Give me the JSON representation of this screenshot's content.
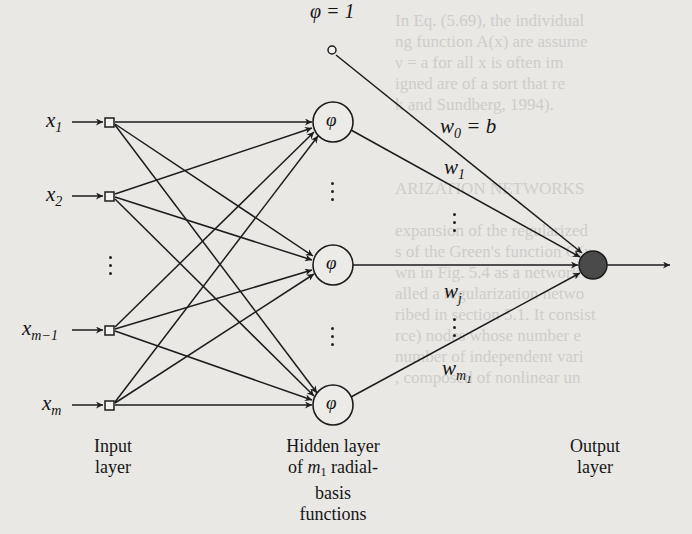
{
  "diagram": {
    "bias": {
      "label": "φ = 1"
    },
    "inputs": [
      {
        "name": "x",
        "sub": "1"
      },
      {
        "name": "x",
        "sub": "2"
      },
      {
        "name": "x",
        "sub": "m−1"
      },
      {
        "name": "x",
        "sub": "m"
      }
    ],
    "hidden_nodes": [
      {
        "symbol": "φ"
      },
      {
        "symbol": "φ"
      },
      {
        "symbol": "φ"
      }
    ],
    "weights": [
      {
        "name": "w",
        "sub": "0",
        "suffix": " = b"
      },
      {
        "name": "w",
        "sub": "1",
        "suffix": ""
      },
      {
        "name": "w",
        "sub": "j",
        "suffix": ""
      },
      {
        "name": "w",
        "sub": "m",
        "sub2": "1",
        "suffix": ""
      }
    ],
    "captions": {
      "input": [
        "Input",
        "layer"
      ],
      "hidden": [
        "Hidden layer",
        "of m₁ radial-",
        "basis",
        "functions"
      ],
      "hidden_parts": {
        "of": "of ",
        "m": "m",
        "m_sub": "1",
        "radial": " radial-"
      },
      "output": [
        "Output",
        "layer"
      ]
    },
    "colors": {
      "line": "#1c1c1c",
      "output_fill": "#4a4a4a",
      "paper": "#e9e8e5"
    }
  },
  "background_text": [
    "In Eq. (5.69), the individual",
    "ng function A(x) are assume",
    "  ν = a  for all x is often im",
    "igned are of a sort that re",
    "k and Sundberg, 1994).",
    "",
    "",
    "",
    "ARIZATION NETWORKS",
    "",
    "expansion of the regularized",
    "s of the Green's function G(x",
    "wn in Fig. 5.4 as a network",
    "alled a regularization netwo",
    "ribed in section 5.1. It consist",
    "rce) nodes whose number e",
    "number of independent vari",
    ", composed of nonlinear un"
  ]
}
